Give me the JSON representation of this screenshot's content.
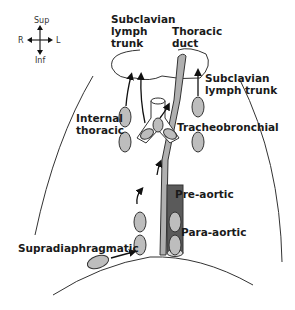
{
  "compass": {
    "sup": "Sup",
    "inf": "Inf",
    "right": "R",
    "left": "L"
  },
  "labels": {
    "subclavian_right_1": "Subclavian",
    "subclavian_right_2": "lymph",
    "subclavian_right_3": "trunk",
    "thoracic_duct_1": "Thoracic",
    "thoracic_duct_2": "duct",
    "subclavian_left_1": "Subclavian",
    "subclavian_left_2": "lymph trunk",
    "internal_thoracic_1": "Internal",
    "internal_thoracic_2": "thoracic",
    "tracheobronchial": "Tracheobronchial",
    "pre_aortic": "Pre-aortic",
    "para_aortic": "Para-aortic",
    "supradiaphragmatic": "Supradiaphragmatic"
  },
  "colors": {
    "node_fill": "#bdbdbd",
    "aorta_fill": "#5a5a5a",
    "duct_fill": "#b0b0b0",
    "stroke": "#333333"
  }
}
